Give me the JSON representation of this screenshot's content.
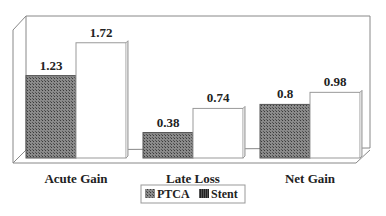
{
  "chart_data": {
    "type": "bar",
    "title": "",
    "xlabel": "",
    "ylabel": "",
    "categories": [
      "Acute Gain",
      "Late Loss",
      "Net Gain"
    ],
    "series": [
      {
        "name": "PTCA",
        "values": [
          1.23,
          0.38,
          0.8
        ],
        "labels": [
          "1.23",
          "0.38",
          "0.8"
        ],
        "fill": "#7a7a7a"
      },
      {
        "name": "Stent",
        "values": [
          1.72,
          0.74,
          0.98
        ],
        "labels": [
          "1.72",
          "0.74",
          "0.98"
        ],
        "fill": "#ffffff"
      }
    ],
    "ylim": [
      0,
      2.0
    ],
    "grid": false,
    "legend_position": "bottom",
    "style": "3d-frame"
  },
  "legend": {
    "items": [
      "PTCA",
      "Stent"
    ]
  }
}
